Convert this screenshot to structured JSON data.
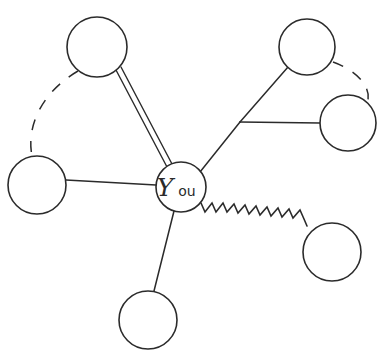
{
  "diagram": {
    "style": "hand-drawn network / relationship map",
    "background_color": "#ffffff",
    "ink_color": "#2b2b2b",
    "center_node": {
      "label_main": "Y",
      "label_rest": "ou",
      "label_full": "You",
      "cx": 181,
      "cy": 187,
      "r": 25
    },
    "nodes": [
      {
        "id": "node-top-left",
        "label": "",
        "cx": 97,
        "cy": 47,
        "r": 30
      },
      {
        "id": "node-top-right",
        "label": "",
        "cx": 307,
        "cy": 47,
        "r": 28
      },
      {
        "id": "node-right",
        "label": "",
        "cx": 348,
        "cy": 123,
        "r": 28
      },
      {
        "id": "node-left",
        "label": "",
        "cx": 37,
        "cy": 185,
        "r": 29
      },
      {
        "id": "node-bottom",
        "label": "",
        "cx": 148,
        "cy": 320,
        "r": 29
      },
      {
        "id": "node-bottom-right",
        "label": "",
        "cx": 332,
        "cy": 252,
        "r": 29
      }
    ],
    "edges": [
      {
        "id": "edge-center-top-left",
        "from": "center",
        "to": "node-top-left",
        "style": "double"
      },
      {
        "id": "edge-center-junction",
        "from": "center",
        "to": "junction",
        "style": "solid"
      },
      {
        "id": "edge-junction-top-right",
        "from": "junction",
        "to": "node-top-right",
        "style": "solid"
      },
      {
        "id": "edge-junction-right",
        "from": "junction",
        "to": "node-right",
        "style": "solid"
      },
      {
        "id": "edge-center-left",
        "from": "center",
        "to": "node-left",
        "style": "solid"
      },
      {
        "id": "edge-center-bottom",
        "from": "center",
        "to": "node-bottom",
        "style": "solid"
      },
      {
        "id": "edge-center-bottom-right",
        "from": "center",
        "to": "node-bottom-right",
        "style": "zigzag"
      },
      {
        "id": "arc-top-left-left",
        "from": "node-top-left",
        "to": "node-left",
        "style": "dashed-arc"
      },
      {
        "id": "arc-top-right-right",
        "from": "node-top-right",
        "to": "node-right",
        "style": "dashed-arc"
      }
    ],
    "junction": {
      "x": 240,
      "y": 122
    }
  }
}
